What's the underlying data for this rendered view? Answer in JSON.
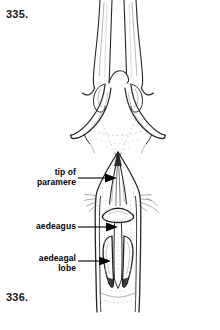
{
  "plate": {
    "background_color": "#ffffff",
    "ink_color": "#1a1a1a",
    "figures": [
      {
        "number_label": "335.",
        "caption_position": "top-left",
        "subject": "male genitalia, parameres spread, dorsal view"
      },
      {
        "number_label": "336.",
        "caption_position": "bottom-left",
        "subject": "male genitalia with aedeagus in situ, dorsal view"
      }
    ]
  },
  "figure_335": {
    "number": "335."
  },
  "figure_336": {
    "number": "336.",
    "callouts": [
      {
        "id": "tip-of-paramere",
        "text": "tip of\nparamere",
        "arrow": "right-pointing-solid-triangle"
      },
      {
        "id": "aedeagus",
        "text": "aedeagus",
        "arrow": "right-pointing-solid-triangle"
      },
      {
        "id": "aedeagal-lobe",
        "text": "aedeagal\nlobe",
        "arrow": "right-pointing-solid-triangle"
      }
    ]
  },
  "colors": {
    "ink": "#1a1a1a",
    "line": "#262626",
    "light_line": "#9a9a9a",
    "faint_line": "#c4c4c4",
    "arrow": "#000000",
    "paper": "#ffffff"
  }
}
